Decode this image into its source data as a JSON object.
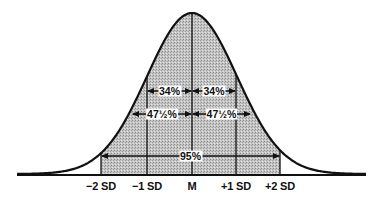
{
  "diagram": {
    "type": "normal-distribution-curve",
    "curve": {
      "mean_x": 192,
      "sd_px": 45,
      "baseline_y": 175,
      "peak_y": 14,
      "x_start": 17,
      "x_end": 366,
      "stroke": "#111111",
      "shade_color": "#bdbdbd"
    },
    "axis_ticks": [
      {
        "label": "−2 SD",
        "x": 101
      },
      {
        "label": "−1 SD",
        "x": 147
      },
      {
        "label": "M",
        "x": 192
      },
      {
        "label": "+1 SD",
        "x": 236
      },
      {
        "label": "+2 SD",
        "x": 280
      }
    ],
    "brackets": [
      {
        "label": "34%",
        "x1": 147,
        "x2": 192,
        "y": 91
      },
      {
        "label": "34%",
        "x1": 192,
        "x2": 236,
        "y": 91
      },
      {
        "label": "47½%",
        "x1": 132,
        "x2": 192,
        "y": 114
      },
      {
        "label": "47½%",
        "x1": 192,
        "x2": 251,
        "y": 114
      },
      {
        "label": "95%",
        "x1": 101,
        "x2": 280,
        "y": 156
      }
    ]
  }
}
